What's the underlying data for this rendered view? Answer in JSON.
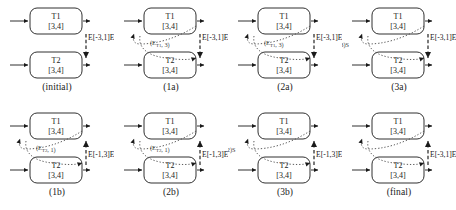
{
  "figure": {
    "rows": 2,
    "columns": 4,
    "colors": {
      "stroke": "#1a1a1a",
      "dashed_edge": "#2b2b2b",
      "dotted_edge": "#555555",
      "text": "#1a1a1a",
      "background": "#ffffff"
    }
  },
  "node_defaults": {
    "top_label": "T1",
    "bottom_label": "T2",
    "top_interval": "[3,4]",
    "bottom_interval": "[3,4]"
  },
  "panels": [
    {
      "id": "initial",
      "caption": "(initial)",
      "nodes": {
        "top": {
          "name": "T1",
          "interval": "[3,4]"
        },
        "bottom": {
          "name": "T2",
          "interval": "[3,4]"
        }
      },
      "right_edge_label": "E[-3,1]E",
      "dotted_label": "",
      "left_label": "",
      "has_dotted_path": false,
      "dashed_target": "top"
    },
    {
      "id": "1a",
      "caption": "(1a)",
      "nodes": {
        "top": {
          "name": "T1",
          "interval": "[3,4]"
        },
        "bottom": {
          "name": "T2",
          "interval": "[3,4]"
        }
      },
      "right_edge_label": "E[-3,1]E",
      "dotted_label": "(E_T1, 3)",
      "left_label": "",
      "has_dotted_path": true,
      "dashed_target": "top"
    },
    {
      "id": "2a",
      "caption": "(2a)",
      "nodes": {
        "top": {
          "name": "T1",
          "interval": "[3,4]"
        },
        "bottom": {
          "name": "T2",
          "interval": "[3,4]"
        }
      },
      "right_edge_label": "E[-3,1]E",
      "dotted_label": "(E_T1, 3)",
      "left_label": "(E_T1, 0)",
      "has_dotted_path": true,
      "dashed_target": "top"
    },
    {
      "id": "3a",
      "caption": "(3a)",
      "nodes": {
        "top": {
          "name": "T1",
          "interval": "[3,4]"
        },
        "bottom": {
          "name": "T2",
          "interval": "[3,4]"
        }
      },
      "right_edge_label": "E[-3,1]E",
      "dotted_label": "",
      "left_label": "S(0, E_T1, 3)S",
      "has_dotted_path": true,
      "dashed_target": "top"
    },
    {
      "id": "1b",
      "caption": "(1b)",
      "nodes": {
        "top": {
          "name": "T1",
          "interval": "[3,4]"
        },
        "bottom": {
          "name": "T2",
          "interval": "[3,4]"
        }
      },
      "right_edge_label": "E[-1,3]E",
      "dotted_label": "(E_T2, 1)",
      "left_label": "",
      "has_dotted_path": true,
      "dashed_target": "bottom"
    },
    {
      "id": "2b",
      "caption": "(2b)",
      "nodes": {
        "top": {
          "name": "T1",
          "interval": "[3,4]"
        },
        "bottom": {
          "name": "T2",
          "interval": "[3,4]"
        }
      },
      "right_edge_label": "E[-1,3]E",
      "dotted_label": "(E_T2, 1)",
      "left_label": "(E_T2, -2)",
      "has_dotted_path": true,
      "dashed_target": "bottom"
    },
    {
      "id": "3b",
      "caption": "(3b)",
      "nodes": {
        "top": {
          "name": "T1",
          "interval": "[3,4]"
        },
        "bottom": {
          "name": "T2",
          "interval": "[3,4]"
        }
      },
      "right_edge_label": "E[-1,3]E",
      "dotted_label": "",
      "left_label": "S(-E_T2, 1,2)S",
      "has_dotted_path": true,
      "dashed_target": "bottom"
    },
    {
      "id": "final",
      "caption": "(final)",
      "nodes": {
        "top": {
          "name": "T1",
          "interval": "[3,4]"
        },
        "bottom": {
          "name": "T2",
          "interval": "[3,4]"
        }
      },
      "right_edge_label": "E[-3,1]E",
      "dotted_label": "",
      "left_label": "S[0,2]S",
      "has_dotted_path": true,
      "dashed_target": "bottom"
    }
  ]
}
